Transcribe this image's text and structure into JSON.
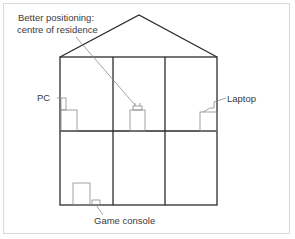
{
  "diagram": {
    "labels": {
      "better_positioning_line1": "Better positioning:",
      "better_positioning_line2": "centre of residence",
      "pc": "PC",
      "laptop": "Laptop",
      "game_console": "Game console"
    },
    "layout": {
      "floors": 2,
      "rooms_per_floor": 3,
      "roof": "triangular gable"
    },
    "devices": [
      {
        "name": "PC",
        "floor": "upper",
        "room": "left"
      },
      {
        "name": "Router",
        "floor": "upper",
        "room": "centre",
        "note": "Better positioning: centre of residence"
      },
      {
        "name": "Laptop",
        "floor": "upper",
        "room": "right"
      },
      {
        "name": "Game console",
        "floor": "lower",
        "room": "left"
      }
    ],
    "colors": {
      "line": "#2b2b2b",
      "device_line": "#8a8a8a",
      "frame": "#d9d9d9",
      "text": "#3a3a3a"
    }
  }
}
